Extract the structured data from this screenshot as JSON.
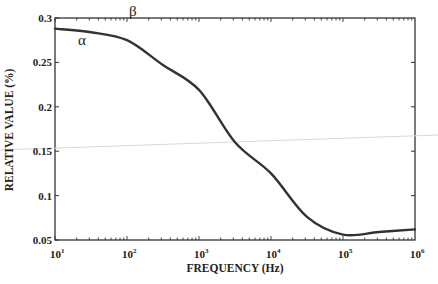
{
  "chart_data": {
    "type": "line",
    "title": "",
    "xlabel": "FREQUENCY (Hz)",
    "ylabel": "RELATIVE VALUE (%)",
    "xscale": "log",
    "xlim": [
      10,
      1000000
    ],
    "ylim": [
      0.05,
      0.3
    ],
    "x_ticks": [
      {
        "base": "10",
        "exp": "1"
      },
      {
        "base": "10",
        "exp": "2"
      },
      {
        "base": "10",
        "exp": "3"
      },
      {
        "base": "10",
        "exp": "4"
      },
      {
        "base": "10",
        "exp": "5"
      },
      {
        "base": "10",
        "exp": "6"
      }
    ],
    "y_ticks": [
      "0.05",
      "0.1",
      "0.15",
      "0.2",
      "0.25",
      "0.3"
    ],
    "grid": false,
    "legend": null,
    "series": [
      {
        "name": "relative value",
        "x": [
          10,
          31.6,
          100,
          316,
          1000,
          3162,
          10000,
          31623,
          100000,
          316228,
          1000000
        ],
        "y": [
          0.288,
          0.284,
          0.275,
          0.247,
          0.219,
          0.16,
          0.125,
          0.076,
          0.056,
          0.059,
          0.062
        ]
      }
    ],
    "annotations": [
      {
        "text": "α",
        "near_x": 31.6,
        "note": "below curve near 10^1.4"
      },
      {
        "text": "β",
        "near_x": 120,
        "note": "above curve near 10^2"
      }
    ]
  },
  "labels": {
    "x_title": "FREQUENCY (Hz)",
    "y_title": "RELATIVE VALUE (%)",
    "alpha": "α",
    "beta": "β",
    "y0": "0.05",
    "y1": "0.1",
    "y2": "0.15",
    "y3": "0.2",
    "y4": "0.25",
    "y5": "0.3",
    "xb": "10",
    "x0e": "1",
    "x1e": "2",
    "x2e": "3",
    "x3e": "4",
    "x4e": "5",
    "x5e": "6"
  }
}
